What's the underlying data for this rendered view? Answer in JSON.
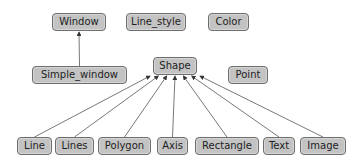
{
  "diagram": {
    "type": "class-hierarchy",
    "nodes": [
      {
        "id": "window",
        "label": "Window",
        "x": 52,
        "y": 13,
        "w": 54
      },
      {
        "id": "line_style",
        "label": "Line_style",
        "x": 126,
        "y": 13,
        "w": 60
      },
      {
        "id": "color",
        "label": "Color",
        "x": 208,
        "y": 13,
        "w": 41
      },
      {
        "id": "simple_window",
        "label": "Simple_window",
        "x": 32,
        "y": 66,
        "w": 95
      },
      {
        "id": "shape",
        "label": "Shape",
        "x": 153,
        "y": 57,
        "w": 44
      },
      {
        "id": "point",
        "label": "Point",
        "x": 228,
        "y": 66,
        "w": 40
      },
      {
        "id": "line",
        "label": "Line",
        "x": 17,
        "y": 137,
        "w": 35
      },
      {
        "id": "lines",
        "label": "Lines",
        "x": 55,
        "y": 137,
        "w": 39
      },
      {
        "id": "polygon",
        "label": "Polygon",
        "x": 98,
        "y": 137,
        "w": 53
      },
      {
        "id": "axis",
        "label": "Axis",
        "x": 157,
        "y": 137,
        "w": 31
      },
      {
        "id": "rectangle",
        "label": "Rectangle",
        "x": 195,
        "y": 137,
        "w": 64
      },
      {
        "id": "text",
        "label": "Text",
        "x": 263,
        "y": 137,
        "w": 32
      },
      {
        "id": "image",
        "label": "Image",
        "x": 300,
        "y": 137,
        "w": 46
      }
    ],
    "edges": [
      {
        "from": "simple_window",
        "to": "window"
      },
      {
        "from": "line",
        "to": "shape"
      },
      {
        "from": "lines",
        "to": "shape"
      },
      {
        "from": "polygon",
        "to": "shape"
      },
      {
        "from": "axis",
        "to": "shape"
      },
      {
        "from": "rectangle",
        "to": "shape"
      },
      {
        "from": "text",
        "to": "shape"
      },
      {
        "from": "image",
        "to": "shape"
      }
    ],
    "colors": {
      "node_fill": "#c3c3c3",
      "node_border": "#6e6e6e",
      "edge": "#333333",
      "text": "#1e1e1e"
    }
  }
}
